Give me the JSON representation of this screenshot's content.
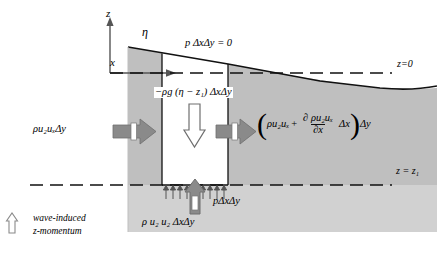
{
  "figure": {
    "type": "control-volume-diagram",
    "domain": "wave-induced z-momentum flux control volume",
    "axes": {
      "z_label": "z",
      "x_label": "x",
      "surface_label": "η"
    },
    "datum_lines": [
      {
        "name": "still-water-level",
        "label": "z=0"
      },
      {
        "name": "lower-boundary",
        "label": "z = z₁"
      }
    ],
    "labels": {
      "pressure_top": "p ΔxΔy = 0",
      "gravity": "−ρg (η − z₁) ΔxΔy",
      "flux_in": "ρu₂uₓΔy",
      "pressure_bottom": "pΔxΔy",
      "z_momentum": "ρ u₂ u₂ ΔxΔy"
    },
    "flux_out": {
      "open_paren": "(",
      "lead": "ρu₂uₓ",
      "plus": "+",
      "numerator": "∂ ρu₂uₓ",
      "denominator": "∂x",
      "after_fraction": "Δx",
      "close_paren": ")",
      "tail": "Δy"
    },
    "legend": {
      "icon": "up-arrow-icon",
      "line1": "wave-induced",
      "line2": "z-momentum"
    },
    "colors": {
      "water_fill": "#bfbfbf",
      "water_fill_lower": "#c9c9c9",
      "arrow_gray": "#8a8a8a",
      "arrow_dark": "#6f6f6f",
      "outline": "#111111",
      "background": "#ffffff"
    }
  }
}
